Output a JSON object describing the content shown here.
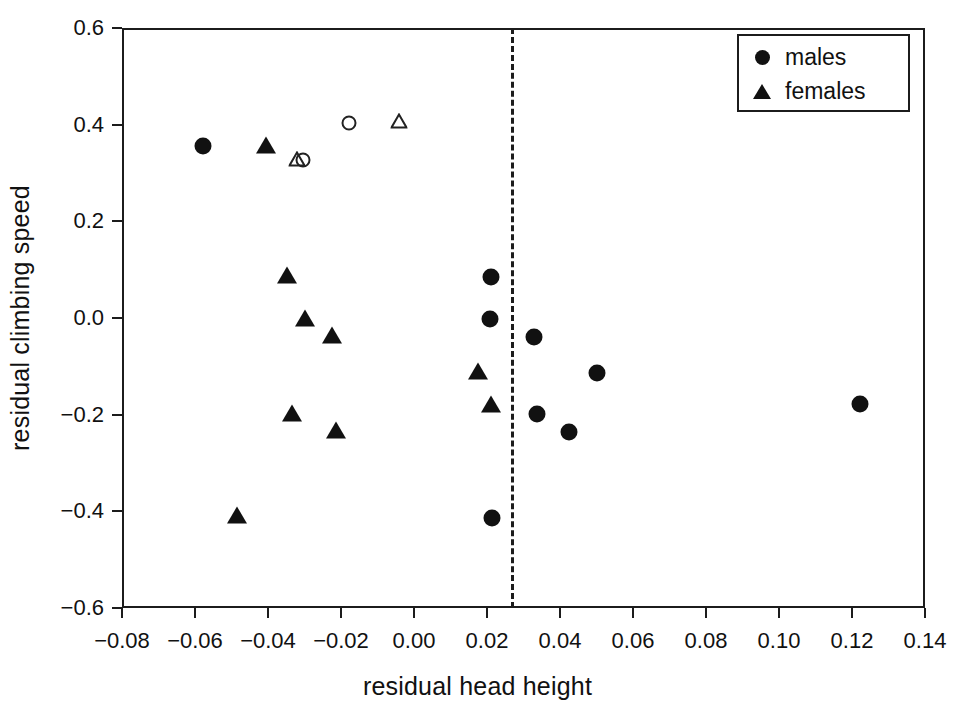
{
  "chart_data": {
    "type": "scatter",
    "title": "",
    "xlabel": "residual head height",
    "ylabel": "residual climbing speed",
    "xlim": [
      -0.08,
      0.14
    ],
    "ylim": [
      -0.6,
      0.6
    ],
    "grid": false,
    "legend_position": "top-right",
    "xticks": [
      -0.08,
      -0.06,
      -0.04,
      -0.02,
      0.0,
      0.02,
      0.04,
      0.06,
      0.08,
      0.1,
      0.12,
      0.14
    ],
    "xtick_labels": [
      "-0.08",
      "-0.06",
      "-0.04",
      "-0.02",
      "0.00",
      "0.02",
      "0.04",
      "0.06",
      "0.08",
      "0.10",
      "0.12",
      "0.14"
    ],
    "yticks": [
      -0.6,
      -0.4,
      -0.2,
      0.0,
      0.2,
      0.4,
      0.6
    ],
    "ytick_labels": [
      "-0.6",
      "-0.4",
      "-0.2",
      "0.0",
      "0.2",
      "0.4",
      "0.6"
    ],
    "legend": [
      {
        "label": "males",
        "marker": "circle-filled"
      },
      {
        "label": "females",
        "marker": "triangle-filled"
      }
    ],
    "annotations": [
      {
        "type": "vline",
        "x": 0.0265,
        "style": "dashed",
        "color": "#1c1c1c"
      }
    ],
    "series": [
      {
        "name": "males",
        "marker": "circle-filled",
        "points": [
          {
            "x": -0.0578,
            "y": 0.355
          },
          {
            "x": 0.0212,
            "y": 0.084
          },
          {
            "x": 0.0208,
            "y": -0.002
          },
          {
            "x": 0.033,
            "y": -0.039
          },
          {
            "x": 0.05,
            "y": -0.114
          },
          {
            "x": 0.0338,
            "y": -0.199
          },
          {
            "x": 0.0424,
            "y": -0.236
          },
          {
            "x": 0.1222,
            "y": -0.178
          },
          {
            "x": 0.0213,
            "y": -0.413
          }
        ]
      },
      {
        "name": "females",
        "marker": "triangle-filled",
        "points": [
          {
            "x": -0.0405,
            "y": 0.358
          },
          {
            "x": -0.0348,
            "y": 0.088
          },
          {
            "x": -0.03,
            "y": 0.0
          },
          {
            "x": -0.0224,
            "y": -0.036
          },
          {
            "x": 0.0175,
            "y": -0.11
          },
          {
            "x": -0.0333,
            "y": -0.196
          },
          {
            "x": -0.0213,
            "y": -0.231
          },
          {
            "x": 0.0212,
            "y": -0.177
          },
          {
            "x": -0.0485,
            "y": -0.408
          }
        ]
      },
      {
        "name": "males-open",
        "marker": "circle-open",
        "points": [
          {
            "x": -0.0177,
            "y": 0.404
          },
          {
            "x": -0.0305,
            "y": 0.327
          }
        ]
      },
      {
        "name": "females-open",
        "marker": "triangle-open",
        "points": [
          {
            "x": -0.004,
            "y": 0.407
          },
          {
            "x": -0.032,
            "y": 0.33
          }
        ]
      }
    ]
  }
}
